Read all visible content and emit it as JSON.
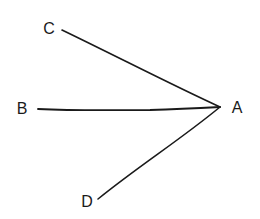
{
  "diagram": {
    "type": "converging-lines",
    "stroke_color": "#1a1a1a",
    "vertex": {
      "id": "A",
      "label": "A",
      "x": 220,
      "y": 107
    },
    "nodes": [
      {
        "id": "C",
        "label": "C",
        "x": 62,
        "y": 30,
        "label_x": 49,
        "label_y": 29
      },
      {
        "id": "B",
        "label": "B",
        "x": 38,
        "y": 109,
        "label_x": 22,
        "label_y": 109
      },
      {
        "id": "D",
        "label": "D",
        "x": 98,
        "y": 199,
        "label_x": 87,
        "label_y": 202
      }
    ],
    "vertex_label_pos": {
      "x": 237,
      "y": 108
    },
    "edges": [
      {
        "from": "C",
        "to": "A"
      },
      {
        "from": "B",
        "to": "A"
      },
      {
        "from": "D",
        "to": "A"
      }
    ]
  }
}
